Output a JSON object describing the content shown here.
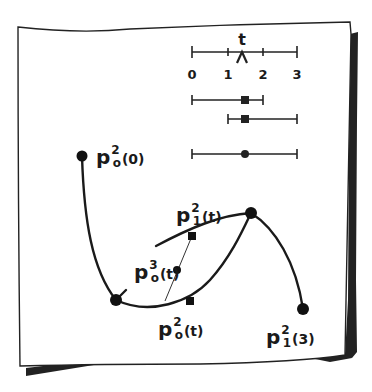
{
  "diagram": {
    "title": "",
    "colors": {
      "ink": "#1a1a1a",
      "paper": "#ffffff",
      "shadow": "#222222"
    },
    "number_line": {
      "variable": "t",
      "ticks": [
        {
          "value": 0,
          "label": "0",
          "x": 192
        },
        {
          "value": 1,
          "label": "1",
          "x": 228
        },
        {
          "value": 2,
          "label": "2",
          "x": 263
        },
        {
          "value": 3,
          "label": "3",
          "x": 297
        }
      ],
      "t_value": 1.5,
      "t_marker": "caret-up"
    },
    "intervals": [
      {
        "start": 0,
        "end": 2,
        "marker": "square",
        "marker_at": 1.5
      },
      {
        "start": 1,
        "end": 3,
        "marker": "square",
        "marker_at": 1.5
      },
      {
        "start": 0,
        "end": 3,
        "marker": "circle",
        "marker_at": 1.5
      }
    ],
    "points": {
      "p0_2_0": {
        "base": "p",
        "sub": "o",
        "sup": "2",
        "arg": "(0)"
      },
      "p1_2_t": {
        "base": "p",
        "sub": "1",
        "sup": "2",
        "arg": "(t)"
      },
      "p0_3_t": {
        "base": "p",
        "sub": "o",
        "sup": "3",
        "arg": "(t)"
      },
      "p0_2_t": {
        "base": "p",
        "sub": "o",
        "sup": "2",
        "arg": "(t)"
      },
      "p1_2_3": {
        "base": "p",
        "sub": "1",
        "sup": "2",
        "arg": "(3)"
      }
    },
    "nodes": [
      {
        "name": "p0-2-0",
        "x": 82,
        "y": 156
      },
      {
        "name": "knot-1",
        "x": 116,
        "y": 300
      },
      {
        "name": "knot-2",
        "x": 251,
        "y": 213
      },
      {
        "name": "p1-2-3",
        "x": 303,
        "y": 309
      },
      {
        "name": "p1-2-t",
        "x": 192,
        "y": 236
      },
      {
        "name": "p0-3-t",
        "x": 177,
        "y": 270
      },
      {
        "name": "p0-2-t",
        "x": 190,
        "y": 301
      }
    ]
  }
}
